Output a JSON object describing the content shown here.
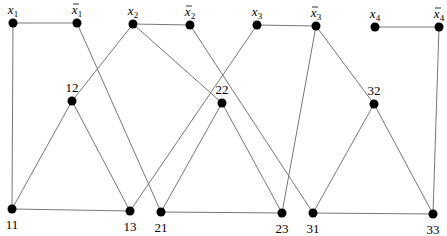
{
  "diagram": {
    "type": "graph",
    "nodes": [
      {
        "id": "x1",
        "label": "x",
        "sub": "1",
        "bar": false,
        "x": 13,
        "y": 23
      },
      {
        "id": "nx1",
        "label": "x",
        "sub": "1",
        "bar": true,
        "x": 77,
        "y": 23
      },
      {
        "id": "x2",
        "label": "x",
        "sub": "2",
        "bar": false,
        "x": 133,
        "y": 24
      },
      {
        "id": "nx2",
        "label": "x",
        "sub": "2",
        "bar": true,
        "x": 190,
        "y": 25
      },
      {
        "id": "x3",
        "label": "x",
        "sub": "3",
        "bar": false,
        "x": 257,
        "y": 25
      },
      {
        "id": "nx3",
        "label": "x",
        "sub": "3",
        "bar": true,
        "x": 316,
        "y": 26
      },
      {
        "id": "x4",
        "label": "x",
        "sub": "4",
        "bar": false,
        "x": 375,
        "y": 27
      },
      {
        "id": "nx4",
        "label": "x",
        "sub": "4",
        "bar": true,
        "x": 439,
        "y": 27
      },
      {
        "id": "12",
        "label": "12",
        "x": 72,
        "y": 101
      },
      {
        "id": "22",
        "label": "22",
        "x": 222,
        "y": 103
      },
      {
        "id": "32",
        "label": "32",
        "x": 374,
        "y": 104
      },
      {
        "id": "11",
        "label": "11",
        "x": 12,
        "y": 209
      },
      {
        "id": "13",
        "label": "13",
        "x": 130,
        "y": 211
      },
      {
        "id": "21",
        "label": "21",
        "x": 161,
        "y": 212
      },
      {
        "id": "23",
        "label": "23",
        "x": 282,
        "y": 213
      },
      {
        "id": "31",
        "label": "31",
        "x": 313,
        "y": 213
      },
      {
        "id": "33",
        "label": "33",
        "x": 433,
        "y": 214
      }
    ],
    "edges": [
      [
        "x1",
        "nx1"
      ],
      [
        "x1",
        "11"
      ],
      [
        "nx1",
        "21"
      ],
      [
        "x2",
        "nx2"
      ],
      [
        "x2",
        "12"
      ],
      [
        "x2",
        "22"
      ],
      [
        "nx2",
        "31"
      ],
      [
        "x3",
        "nx3"
      ],
      [
        "x3",
        "13"
      ],
      [
        "nx3",
        "23"
      ],
      [
        "nx3",
        "32"
      ],
      [
        "x4",
        "nx4"
      ],
      [
        "nx4",
        "33"
      ],
      [
        "12",
        "11"
      ],
      [
        "12",
        "13"
      ],
      [
        "11",
        "13"
      ],
      [
        "22",
        "21"
      ],
      [
        "22",
        "23"
      ],
      [
        "21",
        "23"
      ],
      [
        "32",
        "31"
      ],
      [
        "32",
        "33"
      ],
      [
        "31",
        "33"
      ]
    ]
  }
}
